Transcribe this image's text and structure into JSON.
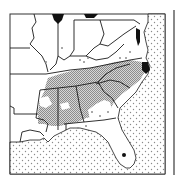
{
  "map": {
    "title": "",
    "region": "Southeastern United States",
    "legend": [],
    "colors": {
      "land": "#ffffff",
      "border": "#1a1a1a",
      "shaded_range": "#b8b8b8",
      "water_dots": "#9a9a9a",
      "water_body": "#111111"
    },
    "features": {
      "shaded_area": "Range across TN, NC, SC, GA, AL, MS",
      "scattered_points": "Isolated occurrences (KY, VA, FL panhandle, GA)",
      "ocean": "Atlantic Ocean and Gulf of Mexico (dotted)",
      "lakes": [
        "Lake Michigan",
        "Lake Erie"
      ],
      "point_marker": "Lake Okeechobee, FL"
    }
  }
}
